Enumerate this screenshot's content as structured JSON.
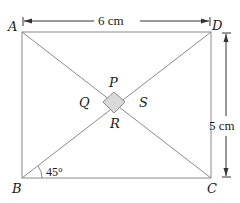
{
  "diagram": {
    "type": "geometry",
    "shape": "rectangle with diagonals",
    "vertices": {
      "A": "A",
      "B": "B",
      "C": "C",
      "D": "D"
    },
    "inner_square": {
      "P": "P",
      "Q": "Q",
      "R": "R",
      "S": "S",
      "fill": "#d9d9d9"
    },
    "dimensions": {
      "width_label": "6 cm",
      "height_label": "5 cm"
    },
    "angle_label": "45°",
    "colors": {
      "line": "#8a8a8a",
      "text": "#1a1a1a",
      "arrow": "#333333"
    }
  }
}
